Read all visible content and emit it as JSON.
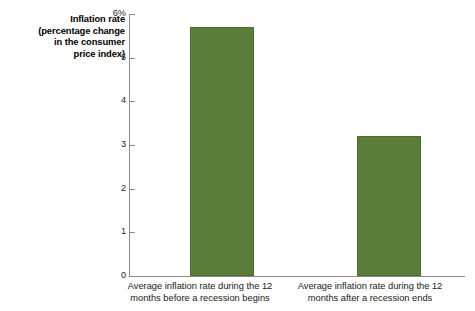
{
  "chart_data": {
    "type": "bar",
    "title": "",
    "subtitle": "",
    "xlabel": "",
    "ylabel_lines": [
      "Inflation rate",
      "(percentage change",
      "in the consumer",
      "price index)"
    ],
    "ylabel": "Inflation rate (percentage change in the consumer price index)",
    "categories": [
      "Average inflation rate during the 12 months before a recession begins",
      "Average inflation rate during the 12 months after a recession ends"
    ],
    "category_lines": [
      [
        "Average inflation rate during the 12",
        "months before a recession begins"
      ],
      [
        "Average inflation rate during the 12",
        "months after a recession ends"
      ]
    ],
    "values": [
      5.7,
      3.2
    ],
    "ylim": [
      0,
      6
    ],
    "ytick_values": [
      0,
      1,
      2,
      3,
      4,
      5,
      6
    ],
    "ytick_labels": [
      "0",
      "1",
      "2",
      "3",
      "4",
      "5",
      "6%"
    ],
    "grid": false,
    "legend": null,
    "bar_color": "#5c7c3a",
    "bar_edge_color": "#4e6b30",
    "axis_color": "#8a8a8a",
    "background_color": "#ffffff"
  }
}
